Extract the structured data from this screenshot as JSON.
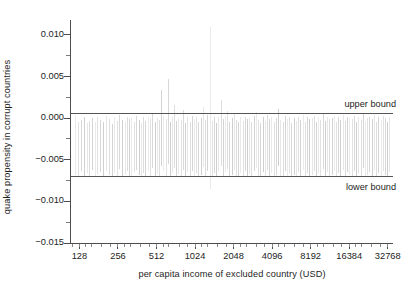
{
  "chart_data": {
    "type": "bar",
    "title": "",
    "subtitle": "",
    "xlabel": "per capita income of excluded country (USD)",
    "ylabel": "quake propensity in corrupt countries",
    "xscale": "log2",
    "xlim": [
      110,
      36000
    ],
    "ylim": [
      -0.015,
      0.0118
    ],
    "grid": false,
    "legend": "none",
    "yticks": [
      {
        "value": 0.01,
        "label": "0.010"
      },
      {
        "value": 0.005,
        "label": "0.005"
      },
      {
        "value": 0.0,
        "label": "0.000"
      },
      {
        "value": -0.005,
        "label": "−0.005"
      },
      {
        "value": -0.01,
        "label": "−0.010"
      },
      {
        "value": -0.015,
        "label": "−0.015"
      }
    ],
    "yticks_minor": [
      0.0125,
      0.0075,
      0.0025,
      -0.0025,
      -0.0075,
      -0.0125
    ],
    "xticks": [
      {
        "value": 128,
        "label": "128"
      },
      {
        "value": 256,
        "label": "256"
      },
      {
        "value": 512,
        "label": "512"
      },
      {
        "value": 1024,
        "label": "1024"
      },
      {
        "value": 2048,
        "label": "2048"
      },
      {
        "value": 4096,
        "label": "4096"
      },
      {
        "value": 8192,
        "label": "8192"
      },
      {
        "value": 16384,
        "label": "16384"
      },
      {
        "value": 32768,
        "label": "32768"
      }
    ],
    "annotations": [
      {
        "name": "upper-bound",
        "label": "upper bound",
        "y": 0.0006,
        "position": "above-right"
      },
      {
        "name": "lower-bound",
        "label": "lower bound",
        "y": -0.007,
        "position": "below-right"
      }
    ],
    "series": [
      {
        "name": "quake propensity (leave-one-out)",
        "color": "#b9b9b9",
        "x": [
          118,
          124,
          131,
          138,
          146,
          152,
          160,
          168,
          176,
          185,
          196,
          206,
          217,
          228,
          240,
          252,
          262,
          274,
          288,
          300,
          312,
          326,
          340,
          356,
          372,
          388,
          404,
          420,
          438,
          456,
          476,
          496,
          516,
          536,
          556,
          580,
          604,
          628,
          652,
          676,
          704,
          732,
          760,
          792,
          824,
          856,
          892,
          928,
          964,
          1004,
          1044,
          1088,
          1132,
          1178,
          1226,
          1276,
          1328,
          1382,
          1438,
          1496,
          1556,
          1620,
          1686,
          1754,
          1824,
          1898,
          1974,
          2054,
          2138,
          2224,
          2314,
          2408,
          2506,
          2608,
          2714,
          2824,
          2940,
          3060,
          3184,
          3314,
          3448,
          3588,
          3734,
          3886,
          4044,
          4208,
          4380,
          4558,
          4744,
          4938,
          5140,
          5350,
          5568,
          5796,
          6034,
          6280,
          6538,
          6806,
          7084,
          7374,
          7676,
          7990,
          8318,
          8658,
          9012,
          9380,
          9764,
          10164,
          10580,
          11012,
          11462,
          11930,
          12418,
          12926,
          13454,
          14004,
          14576,
          15172,
          15792,
          16438,
          17110,
          17810,
          18538,
          19296,
          20084,
          20906,
          21760,
          22650,
          23576,
          24540,
          25544,
          26588,
          27676,
          28808,
          29986,
          31212,
          32488,
          33500
        ],
        "y_top": [
          0.0004,
          -0.0004,
          -0.0002,
          0.0001,
          -0.0006,
          -0.0003,
          0.0,
          -0.0005,
          0.0002,
          -0.0002,
          -0.0004,
          0.0003,
          -0.0001,
          -0.0007,
          0.0001,
          -0.0003,
          0.0004,
          -0.0002,
          -0.0005,
          0.0002,
          -0.0001,
          0.0,
          -0.0004,
          0.0003,
          -0.0002,
          -0.0006,
          0.0001,
          -0.0003,
          0.0002,
          -0.0001,
          0.0005,
          -0.0004,
          0.0,
          -0.0002,
          0.0034,
          0.0003,
          -0.0001,
          0.0047,
          -0.0005,
          0.0002,
          0.0016,
          -0.0003,
          0.0,
          -0.0002,
          0.001,
          -0.0006,
          0.0001,
          -0.0004,
          0.0003,
          -0.0001,
          0.0002,
          -0.0005,
          0.0,
          0.0013,
          -0.0002,
          0.0004,
          0.011,
          -0.0003,
          0.0001,
          -0.0006,
          0.0002,
          0.0022,
          -0.0001,
          0.0003,
          0.0009,
          -0.0004,
          0.0,
          0.0005,
          -0.0002,
          -0.0005,
          0.0001,
          -0.0003,
          0.0002,
          -0.0001,
          0.0,
          -0.0004,
          0.0003,
          0.0008,
          -0.0002,
          -0.0006,
          0.0001,
          -0.0003,
          0.0004,
          -0.0001,
          0.0002,
          -0.0005,
          0.0,
          0.0011,
          -0.0002,
          -0.0004,
          0.0003,
          -0.0001,
          0.0002,
          -0.0006,
          0.0,
          -0.0003,
          0.0001,
          -0.0002,
          0.0004,
          -0.0005,
          0.0002,
          -0.0001,
          0.0,
          0.0003,
          -0.0004,
          0.0001,
          -0.0002,
          0.0005,
          -0.0003,
          0.0002,
          -0.0001,
          0.0,
          0.0003,
          -0.0005,
          0.0001,
          -0.0002,
          0.0004,
          -0.0003,
          0.0002,
          0.0,
          -0.0001,
          0.0003,
          -0.0004,
          0.0001,
          -0.0002,
          0.0005,
          -0.0003,
          0.0,
          0.0002,
          -0.0001,
          0.0004,
          -0.0005,
          0.0001,
          -0.0002,
          0.0003,
          0.0,
          -0.0004,
          0.0002
        ],
        "y_bottom": [
          -0.0068,
          -0.007,
          -0.0064,
          -0.0071,
          -0.0066,
          -0.0069,
          -0.0062,
          -0.007,
          -0.0067,
          -0.0065,
          -0.0071,
          -0.0063,
          -0.0068,
          -0.007,
          -0.0066,
          -0.0069,
          -0.0061,
          -0.007,
          -0.0067,
          -0.0064,
          -0.0069,
          -0.007,
          -0.0065,
          -0.0062,
          -0.0068,
          -0.0071,
          -0.0066,
          -0.0069,
          -0.0063,
          -0.007,
          -0.006,
          -0.0071,
          -0.0067,
          -0.0069,
          -0.0058,
          -0.0064,
          -0.007,
          -0.0055,
          -0.0071,
          -0.0066,
          -0.006,
          -0.0069,
          -0.0067,
          -0.007,
          -0.0062,
          -0.0071,
          -0.0065,
          -0.0069,
          -0.0063,
          -0.007,
          -0.0066,
          -0.0071,
          -0.0068,
          -0.0059,
          -0.007,
          -0.0064,
          -0.0085,
          -0.0069,
          -0.0066,
          -0.0071,
          -0.0063,
          -0.0057,
          -0.007,
          -0.0065,
          -0.0061,
          -0.0071,
          -0.0068,
          -0.0062,
          -0.0069,
          -0.007,
          -0.0066,
          -0.007,
          -0.0064,
          -0.0069,
          -0.0067,
          -0.0071,
          -0.0063,
          -0.006,
          -0.007,
          -0.0071,
          -0.0065,
          -0.0069,
          -0.0062,
          -0.007,
          -0.0066,
          -0.0071,
          -0.0068,
          -0.0058,
          -0.0069,
          -0.0071,
          -0.0064,
          -0.007,
          -0.0066,
          -0.0071,
          -0.0068,
          -0.0069,
          -0.0065,
          -0.007,
          -0.0062,
          -0.0071,
          -0.0066,
          -0.007,
          -0.0068,
          -0.0063,
          -0.0071,
          -0.0066,
          -0.0069,
          -0.0061,
          -0.007,
          -0.0065,
          -0.0069,
          -0.0068,
          -0.0063,
          -0.0071,
          -0.0066,
          -0.007,
          -0.0062,
          -0.0071,
          -0.0065,
          -0.0068,
          -0.0069,
          -0.0064,
          -0.0071,
          -0.0066,
          -0.007,
          -0.006,
          -0.0071,
          -0.0068,
          -0.0065,
          -0.0069,
          -0.0062,
          -0.0071,
          -0.0066,
          -0.007,
          -0.0064,
          -0.0068,
          -0.0071,
          -0.0065
        ]
      }
    ],
    "colors": {
      "spike": "#b9b9b9",
      "axis": "#4d4d4d",
      "bound": "#555555",
      "text": "#1d1d1d",
      "background": "#ffffff"
    }
  }
}
